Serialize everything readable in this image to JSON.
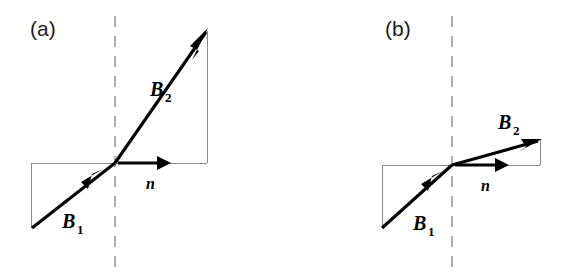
{
  "figure": {
    "background_color": "#ffffff",
    "width": 570,
    "height": 276,
    "vector_color": "#000000",
    "construction_color": "#8a8a8a",
    "boundary_color": "#9a9a9a"
  },
  "panels": [
    {
      "id": "a",
      "tag": "(a)",
      "tag_x": 30,
      "tag_y": 36,
      "boundary": {
        "name": "interface-dashed-line",
        "x": 115,
        "y_top": 16,
        "y_bottom": 268,
        "dash": "11 9"
      },
      "interface_point": {
        "x": 115,
        "y": 163
      },
      "vectors": [
        {
          "name": "B1",
          "label": "B",
          "subscript": "1",
          "label_x": 62,
          "label_y": 228,
          "sub_x": 77,
          "sub_y": 234,
          "tail_x": 32,
          "tail_y": 228,
          "tip_x": 115,
          "tip_y": 163,
          "head_at": "mid",
          "head_x": 93,
          "head_y": 180,
          "angle_deg": 38
        },
        {
          "name": "B2",
          "label": "B",
          "subscript": "2",
          "label_x": 150,
          "label_y": 96,
          "sub_x": 165,
          "sub_y": 102,
          "tail_x": 115,
          "tail_y": 163,
          "tip_x": 207,
          "tip_y": 31,
          "head_at": "tip",
          "angle_deg": 55
        }
      ],
      "normal": {
        "name": "n",
        "label": "n",
        "label_x": 146,
        "label_y": 189,
        "tail_x": 118,
        "tail_y": 163,
        "tip_x": 170,
        "tip_y": 163
      },
      "construction_lines": [
        {
          "name": "lower-left-vertical",
          "x1": 31,
          "y1": 163,
          "x2": 31,
          "y2": 228
        },
        {
          "name": "lower-horizontal",
          "x1": 31,
          "y1": 163,
          "x2": 207,
          "y2": 163
        },
        {
          "name": "upper-right-vertical",
          "x1": 207,
          "y1": 163,
          "x2": 207,
          "y2": 31
        }
      ]
    },
    {
      "id": "b",
      "tag": "(b)",
      "tag_x": 385,
      "tag_y": 36,
      "boundary": {
        "name": "interface-dashed-line",
        "x": 452,
        "y_top": 16,
        "y_bottom": 268,
        "dash": "11 9"
      },
      "interface_point": {
        "x": 452,
        "y": 165
      },
      "vectors": [
        {
          "name": "B1",
          "label": "B",
          "subscript": "1",
          "label_x": 413,
          "label_y": 230,
          "sub_x": 428,
          "sub_y": 236,
          "tail_x": 382,
          "tail_y": 228,
          "tip_x": 452,
          "tip_y": 165,
          "head_at": "mid",
          "head_x": 434,
          "head_y": 181,
          "angle_deg": 42
        },
        {
          "name": "B2",
          "label": "B",
          "subscript": "2",
          "label_x": 498,
          "label_y": 129,
          "sub_x": 513,
          "sub_y": 135,
          "tail_x": 452,
          "tail_y": 165,
          "tip_x": 540,
          "tip_y": 140,
          "head_at": "tip",
          "angle_deg": 16
        }
      ],
      "normal": {
        "name": "n",
        "label": "n",
        "label_x": 481,
        "label_y": 191,
        "tail_x": 455,
        "tail_y": 165,
        "tip_x": 508,
        "tip_y": 165
      },
      "construction_lines": [
        {
          "name": "lower-left-vertical",
          "x1": 382,
          "y1": 165,
          "x2": 382,
          "y2": 228
        },
        {
          "name": "lower-horizontal",
          "x1": 382,
          "y1": 165,
          "x2": 540,
          "y2": 165
        },
        {
          "name": "upper-right-vertical",
          "x1": 540,
          "y1": 165,
          "x2": 540,
          "y2": 140
        }
      ]
    }
  ]
}
